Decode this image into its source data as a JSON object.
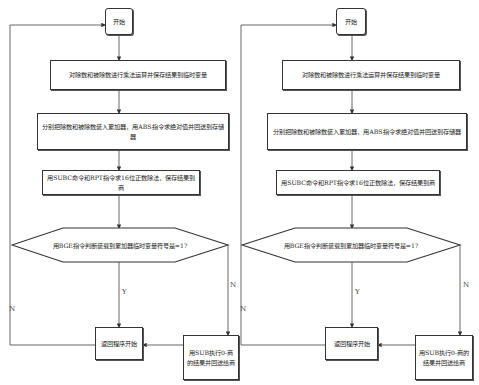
{
  "left_flowchart": {
    "start": "开始",
    "step1": "对除数和被除数进行乘法运算并保存结果到临时变量",
    "step2": "分别把除数和被除数装入累加器，用ABS指令求绝对值并回送到存储器",
    "step3": "用SUBC命令和RPT指令求16位正数除法，保存结果到商",
    "decision": "用BGE指令判断装载到累加器临时变量符号是=1?",
    "yes_label": "Y",
    "no_label_right": "N",
    "no_label_left": "N",
    "return": "返回程序开始",
    "negate": "用SUB执行0-商的结果并回送给商"
  },
  "right_flowchart": {
    "start": "开始",
    "step1": "对除数和被除数进行乘法运算并保存结果到临时变量",
    "step2": "分别把除数和被除数装入累加器，用ABS指令求绝对值并回送到存储器",
    "step3": "用SUBC命令和RPT指令求16位正数除法，保存结果到商",
    "decision": "用BGE指令判断装载到累加器临时变量符号是=1?",
    "yes_label": "Y",
    "no_label_right": "N",
    "no_label_left": "N",
    "return": "返回程序开始",
    "negate": "用SUB执行0-商的结果并回送给商"
  }
}
